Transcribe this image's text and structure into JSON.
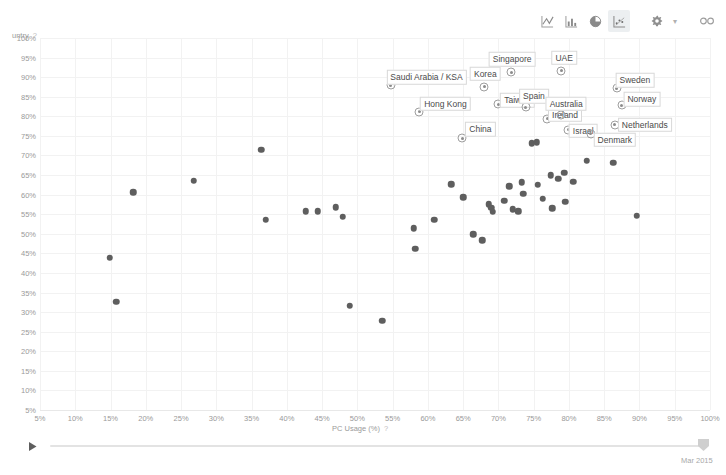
{
  "toolbar": {
    "buttons": [
      {
        "name": "line-chart-icon",
        "label": "Line chart",
        "active": false
      },
      {
        "name": "bar-chart-icon",
        "label": "Bar chart",
        "active": false
      },
      {
        "name": "pie-chart-icon",
        "label": "Pie chart",
        "active": false
      },
      {
        "name": "scatter-chart-icon",
        "label": "Scatter chart",
        "active": true
      }
    ],
    "settings_label": "Settings",
    "settings_caret": "▾",
    "share_label": "Share link"
  },
  "timeline": {
    "play_label": "Play",
    "current_label": "Mar 2015"
  },
  "chart_data": {
    "type": "scatter",
    "title": "",
    "xlabel": "PC Usage (%)",
    "ylabel": "untry",
    "xlabel_help": "?",
    "ylabel_help": "?",
    "grid": true,
    "legend": "none",
    "xlim": [
      5,
      100
    ],
    "ylim": [
      5,
      100
    ],
    "xticks": [
      "5%",
      "10%",
      "15%",
      "20%",
      "25%",
      "30%",
      "35%",
      "40%",
      "45%",
      "50%",
      "55%",
      "60%",
      "65%",
      "70%",
      "75%",
      "80%",
      "85%",
      "90%",
      "95%",
      "100%"
    ],
    "yticks": [
      "5%",
      "10%",
      "15%",
      "20%",
      "25%",
      "30%",
      "35%",
      "40%",
      "45%",
      "50%",
      "55%",
      "60%",
      "65%",
      "70%",
      "75%",
      "80%",
      "85%",
      "90%",
      "95%",
      "100%"
    ],
    "xtick_values": [
      5,
      10,
      15,
      20,
      25,
      30,
      35,
      40,
      45,
      50,
      55,
      60,
      65,
      70,
      75,
      80,
      85,
      90,
      95,
      100
    ],
    "ytick_values": [
      5,
      10,
      15,
      20,
      25,
      30,
      35,
      40,
      45,
      50,
      55,
      60,
      65,
      70,
      75,
      80,
      85,
      90,
      95,
      100
    ],
    "marker_color": "#5e5e5e",
    "highlight_marker_color": "#9e9e9e",
    "points": [
      {
        "x": 15.8,
        "y": 32.6,
        "label": null
      },
      {
        "x": 14.9,
        "y": 43.9,
        "label": null
      },
      {
        "x": 18.2,
        "y": 60.6,
        "label": null
      },
      {
        "x": 26.8,
        "y": 63.5,
        "label": null
      },
      {
        "x": 36.4,
        "y": 71.5,
        "label": null
      },
      {
        "x": 37.0,
        "y": 53.6,
        "label": null
      },
      {
        "x": 42.7,
        "y": 55.8,
        "label": null
      },
      {
        "x": 44.4,
        "y": 55.8,
        "label": null
      },
      {
        "x": 46.9,
        "y": 56.8,
        "label": null
      },
      {
        "x": 47.9,
        "y": 54.4,
        "label": null
      },
      {
        "x": 48.9,
        "y": 31.6,
        "label": null
      },
      {
        "x": 53.5,
        "y": 27.8,
        "label": null
      },
      {
        "x": 58.0,
        "y": 51.4,
        "label": null
      },
      {
        "x": 58.2,
        "y": 46.2,
        "label": null
      },
      {
        "x": 60.9,
        "y": 53.6,
        "label": null
      },
      {
        "x": 63.3,
        "y": 62.7,
        "label": null
      },
      {
        "x": 65.0,
        "y": 59.3,
        "label": null
      },
      {
        "x": 66.4,
        "y": 49.9,
        "label": null
      },
      {
        "x": 67.7,
        "y": 48.4,
        "label": null
      },
      {
        "x": 68.6,
        "y": 57.6,
        "label": null
      },
      {
        "x": 69.0,
        "y": 56.6,
        "label": null
      },
      {
        "x": 69.2,
        "y": 55.6,
        "label": null
      },
      {
        "x": 70.8,
        "y": 58.4,
        "label": null
      },
      {
        "x": 71.5,
        "y": 62.2,
        "label": null
      },
      {
        "x": 72.0,
        "y": 56.3,
        "label": null
      },
      {
        "x": 72.8,
        "y": 55.7,
        "label": null
      },
      {
        "x": 73.3,
        "y": 63.2,
        "label": null
      },
      {
        "x": 73.5,
        "y": 60.2,
        "label": null
      },
      {
        "x": 74.7,
        "y": 73.1,
        "label": null
      },
      {
        "x": 75.4,
        "y": 73.4,
        "label": null
      },
      {
        "x": 75.6,
        "y": 62.5,
        "label": null
      },
      {
        "x": 76.3,
        "y": 58.9,
        "label": null
      },
      {
        "x": 77.4,
        "y": 65.0,
        "label": null
      },
      {
        "x": 77.6,
        "y": 56.5,
        "label": null
      },
      {
        "x": 78.5,
        "y": 64.0,
        "label": null
      },
      {
        "x": 79.3,
        "y": 65.6,
        "label": null
      },
      {
        "x": 79.5,
        "y": 58.2,
        "label": null
      },
      {
        "x": 80.6,
        "y": 63.3,
        "label": null
      },
      {
        "x": 82.5,
        "y": 68.6,
        "label": null
      },
      {
        "x": 86.3,
        "y": 68.2,
        "label": null
      },
      {
        "x": 89.6,
        "y": 54.6,
        "label": null
      },
      {
        "x": 54.7,
        "y": 87.9,
        "label": "Saudi Arabia / KSA",
        "label_dx": 36,
        "label_dy": -8
      },
      {
        "x": 58.8,
        "y": 81.2,
        "label": "Hong Kong",
        "label_dx": 26,
        "label_dy": -8
      },
      {
        "x": 64.9,
        "y": 74.4,
        "label": "China",
        "label_dx": 18,
        "label_dy": -9
      },
      {
        "x": 68.0,
        "y": 87.5,
        "label": "Korea",
        "label_dx": 1,
        "label_dy": -13
      },
      {
        "x": 70.0,
        "y": 83.1,
        "label": "Taiwan",
        "label_dx": 19,
        "label_dy": -4
      },
      {
        "x": 71.8,
        "y": 91.2,
        "label": "Singapore",
        "label_dx": 1,
        "label_dy": -13
      },
      {
        "x": 73.9,
        "y": 82.3,
        "label": "Spain",
        "label_dx": 8,
        "label_dy": -11
      },
      {
        "x": 76.9,
        "y": 79.4,
        "label": "Ireland",
        "label_dx": 18,
        "label_dy": -4
      },
      {
        "x": 78.9,
        "y": 91.7,
        "label": "UAE",
        "label_dx": 3,
        "label_dy": -13
      },
      {
        "x": 78.9,
        "y": 80.4,
        "label": "Australia",
        "label_dx": 5,
        "label_dy": -11
      },
      {
        "x": 79.9,
        "y": 76.6,
        "label": "Israel",
        "label_dx": 15,
        "label_dy": 1
      },
      {
        "x": 83.1,
        "y": 75.5,
        "label": "Denmark",
        "label_dx": 24,
        "label_dy": 6
      },
      {
        "x": 86.8,
        "y": 87.2,
        "label": "Sweden",
        "label_dx": 18,
        "label_dy": -8
      },
      {
        "x": 87.5,
        "y": 82.8,
        "label": "Norway",
        "label_dx": 20,
        "label_dy": -6
      },
      {
        "x": 86.5,
        "y": 77.8,
        "label": "Netherlands",
        "label_dx": 30,
        "label_dy": 0
      }
    ]
  }
}
